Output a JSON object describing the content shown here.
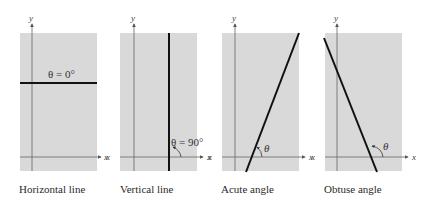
{
  "colors": {
    "panel": "#d9d9d9",
    "axis": "#666666",
    "line": "#111111",
    "text": "#2a2a2a"
  },
  "panels": [
    {
      "caption": "Horizontal line",
      "angle_label": "θ = 0°",
      "x_label": "x",
      "y_label": "y"
    },
    {
      "caption": "Vertical line",
      "angle_label": "θ = 90°",
      "x_label": "x",
      "x_label_left": "x",
      "y_label": "y"
    },
    {
      "caption": "Acute angle",
      "angle_label": "θ",
      "x_label": "x",
      "x_label_left": "x",
      "y_label": "y"
    },
    {
      "caption": "Obtuse angle",
      "angle_label": "θ",
      "x_label": "x",
      "x_label_left": "x",
      "y_label": "y"
    }
  ]
}
